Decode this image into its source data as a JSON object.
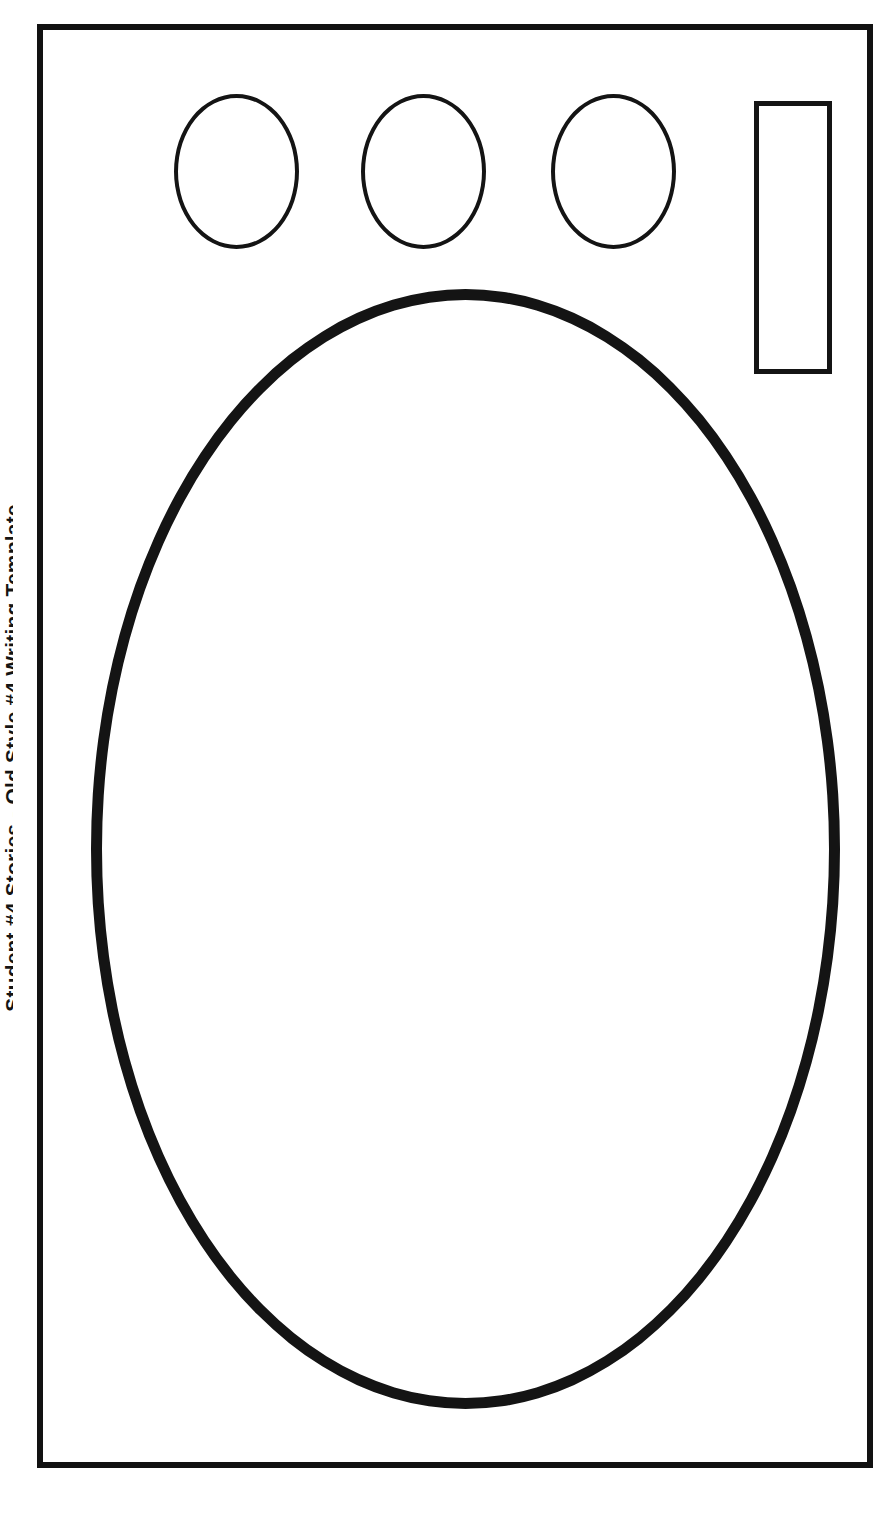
{
  "page": {
    "title": "Student #4 Stories - Old Style #4 Writing Template",
    "caption": "Student #4 Stories - Old Style #4 Writing Template",
    "background_color": "#ffffff",
    "ink_color": "#141414",
    "width": 884,
    "height": 1515
  },
  "frame": {
    "name": "page-border",
    "stroke_color": "#111111",
    "stroke_width": 6
  },
  "shapes": {
    "small_ellipses": [
      {
        "label": "",
        "index": 1,
        "stroke_color": "#141414",
        "stroke_width": 4
      },
      {
        "label": "",
        "index": 2,
        "stroke_color": "#141414",
        "stroke_width": 4
      },
      {
        "label": "",
        "index": 3,
        "stroke_color": "#141414",
        "stroke_width": 4
      }
    ],
    "vertical_rectangle": {
      "label": "",
      "stroke_color": "#141414",
      "stroke_width": 5
    },
    "large_ellipse": {
      "label": "",
      "stroke_color": "#141414",
      "stroke_width": 11
    }
  }
}
